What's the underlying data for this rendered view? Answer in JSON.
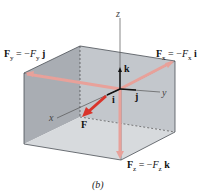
{
  "figure": {
    "caption": "(b)",
    "axes": {
      "x": "x",
      "y": "y",
      "z": "z"
    },
    "unit_vectors": {
      "i": "i",
      "j": "j",
      "k": "k"
    },
    "force_label": "F",
    "components": {
      "fy": {
        "vec": "F",
        "sub": "y",
        "eq": " = −",
        "mag": "F",
        "magsub": "y",
        "unit": "j"
      },
      "fx": {
        "vec": "F",
        "sub": "x",
        "eq": " = −",
        "mag": "F",
        "magsub": "x",
        "unit": "i"
      },
      "fz": {
        "vec": "F",
        "sub": "z",
        "eq": " = −",
        "mag": "F",
        "magsub": "z",
        "unit": "k"
      }
    },
    "colors": {
      "box_left": "#a9adb3",
      "box_back": "#c3c7cc",
      "box_top": "#9aa0a6",
      "box_floor": "#d7dadd",
      "force_line": "#e8a19a",
      "force_arrow": "#d9342b",
      "axis": "#222222"
    }
  }
}
